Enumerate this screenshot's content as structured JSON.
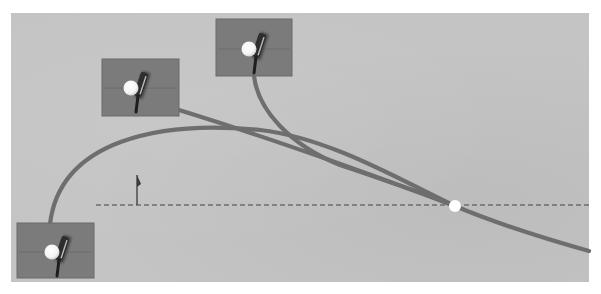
{
  "diagram": {
    "type": "golf-ball-flight-paths",
    "colors": {
      "background": "#c4c4c4",
      "inset_fill": "#7b7b7b",
      "inset_border": "#6a6a6a",
      "path": "#6e6e6e",
      "target_line": "#6e6e6e",
      "ball": "#ffffff",
      "club": "#2e2e2e",
      "flag": "#3a3a3a"
    },
    "panel": {
      "x": 11,
      "y": 13,
      "width": 578,
      "height": 269
    },
    "target_line": {
      "x1": 96,
      "y1": 205,
      "x2": 589,
      "y2": 205,
      "style": "dashed"
    },
    "flag": {
      "x": 137,
      "y_base": 205,
      "y_top": 175
    },
    "target_ball": {
      "x": 455,
      "y": 206,
      "r": 6
    },
    "insets": [
      {
        "id": "address-left",
        "x": 17,
        "y": 223,
        "width": 77,
        "height": 55,
        "ball": {
          "x": 52,
          "y": 252
        }
      },
      {
        "id": "address-middle",
        "x": 102,
        "y": 59,
        "width": 77,
        "height": 57,
        "ball": {
          "x": 131,
          "y": 88
        }
      },
      {
        "id": "address-top",
        "x": 216,
        "y": 19,
        "width": 76,
        "height": 57,
        "ball": {
          "x": 249,
          "y": 49
        }
      }
    ],
    "paths": [
      {
        "id": "path-from-left",
        "d": "M 50 224 C 60 140, 160 120, 260 130 C 330 138, 400 180, 455 206 C 500 225, 550 240, 589 251"
      },
      {
        "id": "path-from-middle",
        "d": "M 179 110 C 260 135, 360 170, 455 206"
      },
      {
        "id": "path-from-top",
        "d": "M 254 76 C 258 110, 290 145, 340 165 C 390 182, 420 192, 455 206"
      }
    ]
  }
}
